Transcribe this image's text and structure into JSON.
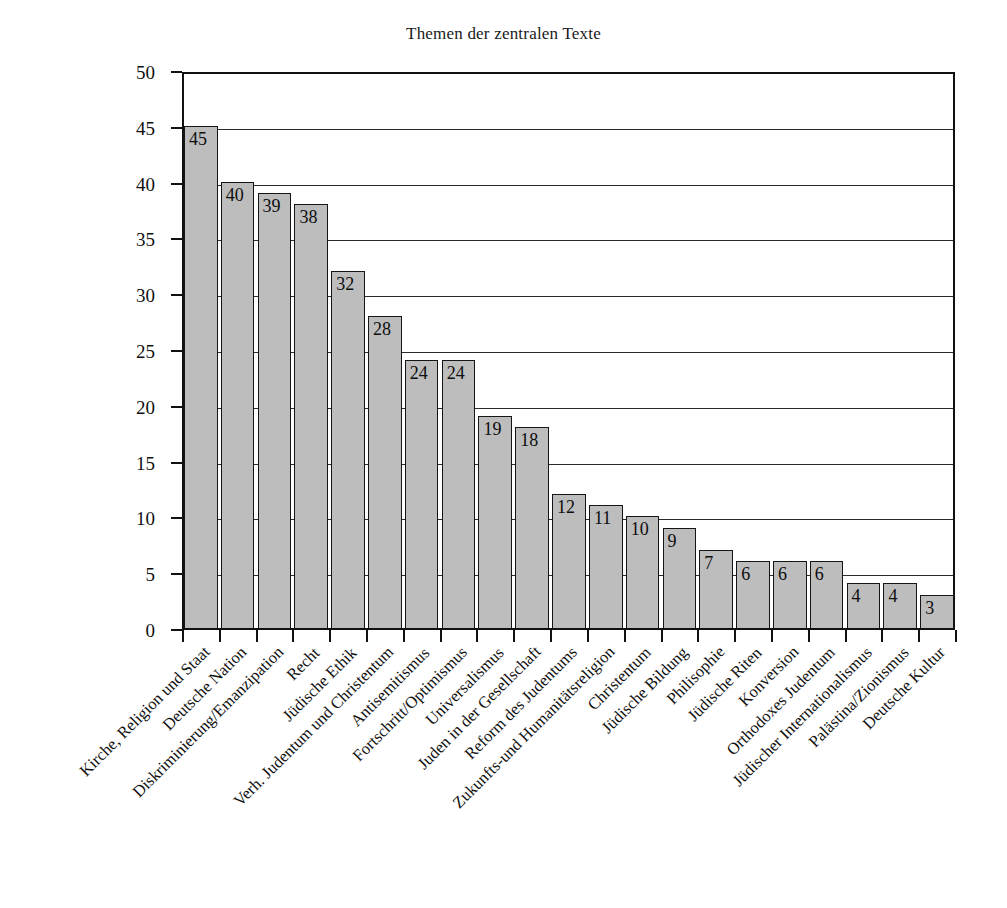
{
  "chart_data": {
    "type": "bar",
    "title": "Themen der zentralen Texte",
    "xlabel": "",
    "ylabel": "",
    "ylim": [
      0,
      50
    ],
    "ytick_step": 5,
    "yticks": [
      0,
      5,
      10,
      15,
      20,
      25,
      30,
      35,
      40,
      45,
      50
    ],
    "grid": "horizontal",
    "legend": "none",
    "bar_fill_color": "#bdbdbd",
    "bar_border_color": "#151515",
    "value_labels": true,
    "categories": [
      "Kirche, Religion und Staat",
      "Deutsche Nation",
      "Diskriminierung/Emanzipation",
      "Recht",
      "Jüdische Ethik",
      "Verh. Judentum und Christentum",
      "Antisemitismus",
      "Fortschritt/Optimismus",
      "Universalismus",
      "Juden in der Gesellschaft",
      "Reform des Judentums",
      "Zukunfts-und Humanitätsreligion",
      "Christentum",
      "Jüdische Bildung",
      "Philisophie",
      "Jüdische Riten",
      "Konversion",
      "Orthodoxes Judentum",
      "Jüdischer Internationalismus",
      "Palästina/Zionismus",
      "Deutsche Kultur"
    ],
    "values": [
      45,
      40,
      39,
      38,
      32,
      28,
      24,
      24,
      19,
      18,
      12,
      11,
      10,
      9,
      7,
      6,
      6,
      6,
      4,
      4,
      3
    ]
  }
}
